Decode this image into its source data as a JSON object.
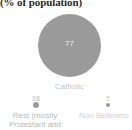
{
  "chart_data": {
    "type": "bubble",
    "title": "(% of population)",
    "xlabel": "",
    "ylabel": "",
    "categories": [
      "Catholic",
      "Rest (mostly Protestant and",
      "Non Believers"
    ],
    "values": [
      77,
      18,
      5
    ],
    "series": [
      {
        "name": "Share of population",
        "values": [
          77,
          18,
          5
        ]
      }
    ],
    "labels": {
      "main_value": "77",
      "main_category": "Catholic",
      "mid_value": "18",
      "mid_category_line1": "Rest (mostly",
      "mid_category_line2": "Protestant and",
      "small_value": "5",
      "small_category": "Non Believers"
    },
    "colors": {
      "bubble": "#9a9a9a",
      "background": "#ffffff",
      "title_text": "#2b2b2b",
      "category_text": "#c0c0c0",
      "value_inside_text": "#ededed"
    },
    "grid": false,
    "legend": "none"
  }
}
